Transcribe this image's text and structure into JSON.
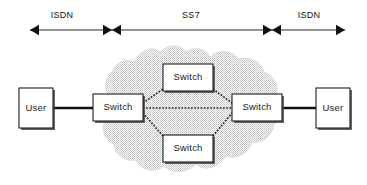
{
  "diagram": {
    "background_color": "#ffffff",
    "line_color": "#111111",
    "cloud_fill_color": "#d9d9d9",
    "box_fill_color": "#ffffff",
    "box_stroke_color": "#1c1c1c"
  },
  "spans": [
    {
      "id": "span-isdn-left",
      "label": "ISDN",
      "label_x": 62,
      "label_y": 16,
      "line_y": 30,
      "x_start": 30,
      "x_end": 112,
      "arrow_start": "outward",
      "arrow_end": "inward"
    },
    {
      "id": "span-ss7",
      "label": "SS7",
      "label_x": 191,
      "label_y": 16,
      "line_y": 30,
      "x_start": 112,
      "x_end": 272,
      "arrow_start": "inward",
      "arrow_end": "inward"
    },
    {
      "id": "span-isdn-right",
      "label": "ISDN",
      "label_x": 309,
      "label_y": 16,
      "line_y": 30,
      "x_start": 272,
      "x_end": 345,
      "arrow_start": "inward",
      "arrow_end": "outward"
    }
  ],
  "nodes": [
    {
      "id": "user-left",
      "label": "User",
      "x": 19,
      "y": 88,
      "w": 34,
      "h": 40,
      "cx": 36,
      "cy": 108
    },
    {
      "id": "switch-left",
      "label": "Switch",
      "x": 93,
      "y": 94,
      "w": 50,
      "h": 27,
      "cx": 118,
      "cy": 107.5
    },
    {
      "id": "switch-top",
      "label": "Switch",
      "x": 163,
      "y": 64,
      "w": 50,
      "h": 27,
      "cx": 188,
      "cy": 77.5
    },
    {
      "id": "switch-bottom",
      "label": "Switch",
      "x": 163,
      "y": 135,
      "w": 50,
      "h": 27,
      "cx": 188,
      "cy": 148.5
    },
    {
      "id": "switch-right",
      "label": "Switch",
      "x": 232,
      "y": 94,
      "w": 50,
      "h": 27,
      "cx": 257,
      "cy": 107.5
    },
    {
      "id": "user-right",
      "label": "User",
      "x": 316,
      "y": 88,
      "w": 34,
      "h": 40,
      "cx": 333,
      "cy": 108
    }
  ],
  "trunk_links": [
    {
      "id": "link-user-left-switch-left",
      "x1": 53,
      "y1": 108,
      "x2": 93,
      "y2": 108
    },
    {
      "id": "link-switch-right-user-right",
      "x1": 282,
      "y1": 108,
      "x2": 316,
      "y2": 108
    }
  ],
  "mesh_links": [
    {
      "id": "mesh-left-to-top",
      "x1": 143,
      "y1": 103,
      "x2": 163,
      "y2": 89
    },
    {
      "id": "mesh-top-to-right",
      "x1": 213,
      "y1": 89,
      "x2": 232,
      "y2": 103
    },
    {
      "id": "mesh-left-to-right",
      "x1": 143,
      "y1": 108,
      "x2": 232,
      "y2": 108
    },
    {
      "id": "mesh-left-to-bottom",
      "x1": 143,
      "y1": 113,
      "x2": 163,
      "y2": 136
    },
    {
      "id": "mesh-bottom-to-right",
      "x1": 213,
      "y1": 136,
      "x2": 232,
      "y2": 113
    }
  ],
  "cloud": {
    "id": "ss7-network-cloud",
    "path": "M 112 100 C 104 92 103 80 112 72 C 116 62 126 58 134 62 C 140 50 152 45 160 52 C 168 44 180 44 186 52 C 194 46 206 48 210 57 C 218 49 232 50 238 59 C 250 56 262 62 264 72 C 274 76 280 86 276 96 C 284 104 284 118 274 124 C 272 136 262 144 252 142 C 248 154 236 160 226 156 C 218 168 204 172 196 164 C 186 174 172 174 164 166 C 154 174 140 170 136 160 C 124 162 114 154 114 144 C 104 140 100 128 106 120 C 100 114 102 104 112 100 Z"
  }
}
